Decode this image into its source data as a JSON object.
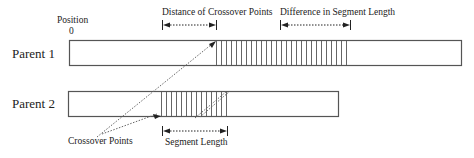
{
  "diagram": {
    "labels": {
      "position": "Position",
      "origin": "0",
      "distance_of_crossover_points": "Distance of Crossover Points",
      "difference_in_segment_length": "Difference in Segment Length",
      "crossover_points": "Crossover Points",
      "segment_length": "Segment Length"
    },
    "parents": [
      {
        "name": "Parent 1",
        "bar": {
          "x": 69,
          "y": 40,
          "w": 393,
          "h": 25
        },
        "segment": {
          "x_start": 216,
          "x_end": 350,
          "hatch_spacing": 5
        }
      },
      {
        "name": "Parent 2",
        "bar": {
          "x": 68,
          "y": 91,
          "w": 271,
          "h": 25
        },
        "segment": {
          "x_start": 161,
          "x_end": 227,
          "hatch_spacing": 5
        }
      }
    ],
    "colors": {
      "stroke": "#555555",
      "text": "#222222",
      "dotted": "#666666"
    }
  }
}
